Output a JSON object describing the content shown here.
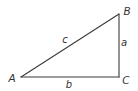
{
  "diagram": {
    "type": "right-triangle",
    "stroke_color": "#3a3a3a",
    "label_color": "#333333",
    "vertices": {
      "A": {
        "label": "A",
        "x": 21,
        "y": 77,
        "label_x": 12,
        "label_y": 78
      },
      "B": {
        "label": "B",
        "x": 119,
        "y": 14,
        "label_x": 127,
        "label_y": 11
      },
      "C": {
        "label": "C",
        "x": 119,
        "y": 77,
        "label_x": 126,
        "label_y": 80
      }
    },
    "sides": {
      "a": {
        "label": "a",
        "from": "B",
        "to": "C",
        "label_x": 124,
        "label_y": 43
      },
      "b": {
        "label": "b",
        "from": "A",
        "to": "C",
        "label_x": 69,
        "label_y": 85
      },
      "c": {
        "label": "c",
        "from": "A",
        "to": "B",
        "label_x": 65,
        "label_y": 40
      }
    },
    "right_angle_at": "C"
  }
}
